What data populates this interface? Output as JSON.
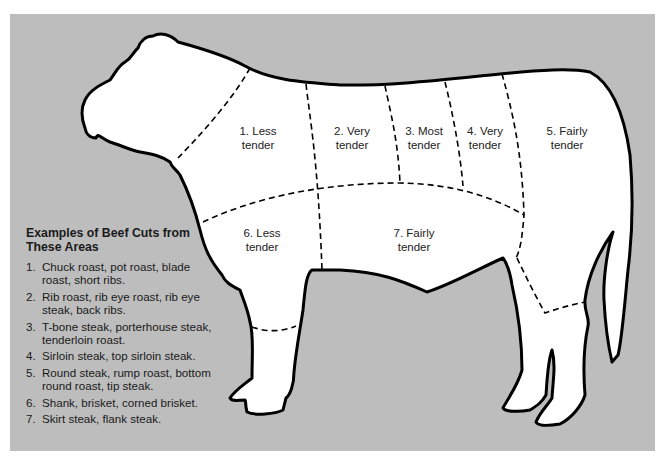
{
  "diagram": {
    "background_color": "#bdbdbd",
    "outline_color": "#000000",
    "fill_color": "#ffffff",
    "regions": [
      {
        "id": 1,
        "label_line1": "1. Less",
        "label_line2": "tender"
      },
      {
        "id": 2,
        "label_line1": "2. Very",
        "label_line2": "tender"
      },
      {
        "id": 3,
        "label_line1": "3. Most",
        "label_line2": "tender"
      },
      {
        "id": 4,
        "label_line1": "4. Very",
        "label_line2": "tender"
      },
      {
        "id": 5,
        "label_line1": "5. Fairly",
        "label_line2": "tender"
      },
      {
        "id": 6,
        "label_line1": "6. Less",
        "label_line2": "tender"
      },
      {
        "id": 7,
        "label_line1": "7. Fairly",
        "label_line2": "tender"
      }
    ]
  },
  "legend": {
    "title": "Examples of Beef Cuts from These Areas",
    "items": [
      {
        "num": "1.",
        "text": "Chuck roast, pot roast, blade roast, short ribs."
      },
      {
        "num": "2.",
        "text": "Rib roast, rib eye roast, rib eye steak, back ribs."
      },
      {
        "num": "3.",
        "text": "T-bone steak, porterhouse steak, tenderloin roast."
      },
      {
        "num": "4.",
        "text": "Sirloin steak, top sirloin steak."
      },
      {
        "num": "5.",
        "text": "Round steak, rump roast, bottom round roast, tip steak."
      },
      {
        "num": "6.",
        "text": "Shank, brisket, corned brisket."
      },
      {
        "num": "7.",
        "text": "Skirt steak, flank steak."
      }
    ]
  }
}
